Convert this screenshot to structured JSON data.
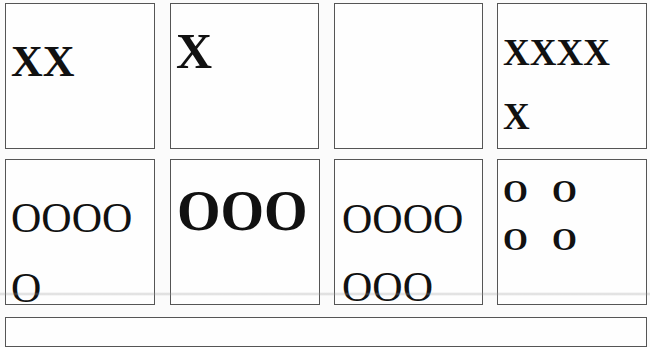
{
  "tiles": {
    "row1": [
      {
        "lines": [
          "XX"
        ]
      },
      {
        "lines": [
          "X"
        ]
      },
      {
        "lines": []
      },
      {
        "lines": [
          "XXXX",
          "X"
        ]
      }
    ],
    "row2": [
      {
        "lines": [
          "OOOO",
          "O"
        ]
      },
      {
        "lines": [
          "OOO"
        ]
      },
      {
        "lines": [
          "OOOO",
          "OOO"
        ]
      },
      {
        "lines": [
          "O   O",
          "O   O"
        ]
      }
    ]
  },
  "colors": {
    "border": "#555555",
    "background": "#fbfbfb",
    "text": "#111111"
  }
}
